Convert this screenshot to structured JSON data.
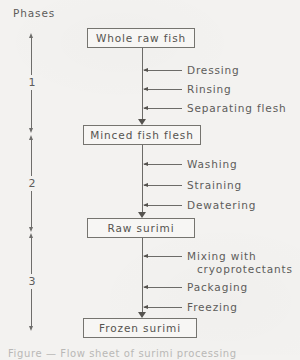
{
  "figure": {
    "type": "flow-diagram",
    "background_color": "#f3f2f0",
    "line_color": "#6c6b68",
    "text_color": "#5d5c5a"
  },
  "phases_axis": {
    "title": "Phases",
    "markers": [
      {
        "number": "1",
        "top": 33,
        "bottom": 133
      },
      {
        "number": "2",
        "top": 135,
        "bottom": 232
      },
      {
        "number": "3",
        "top": 233,
        "bottom": 331
      }
    ]
  },
  "stages": [
    {
      "label": "Whole raw fish",
      "left": 87,
      "top": 28,
      "width": 108,
      "height": 20
    },
    {
      "label": "Minced fish flesh",
      "left": 83,
      "top": 125,
      "width": 118,
      "height": 20
    },
    {
      "label": "Raw surimi",
      "left": 87,
      "top": 218,
      "width": 108,
      "height": 20
    },
    {
      "label": "Frozen surimi",
      "left": 83,
      "top": 318,
      "width": 114,
      "height": 20
    }
  ],
  "operations": [
    {
      "label": "Dressing",
      "continuation": "",
      "y": 70
    },
    {
      "label": "Rinsing",
      "continuation": "",
      "y": 89
    },
    {
      "label": "Separating flesh",
      "continuation": "",
      "y": 108
    },
    {
      "label": "Washing",
      "continuation": "",
      "y": 164
    },
    {
      "label": "Straining",
      "continuation": "",
      "y": 185
    },
    {
      "label": "Dewatering",
      "continuation": "",
      "y": 205
    },
    {
      "label": "Mixing with",
      "continuation": "cryoprotectants",
      "y": 256
    },
    {
      "label": "Packaging",
      "continuation": "",
      "y": 287
    },
    {
      "label": "Freezing",
      "continuation": "",
      "y": 307
    }
  ],
  "caption": {
    "text": "Figure  —  Flow sheet of surimi processing"
  }
}
